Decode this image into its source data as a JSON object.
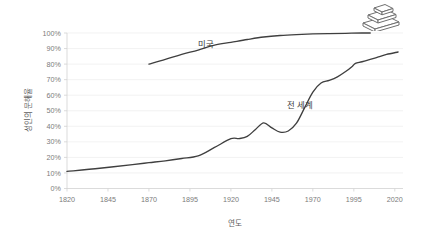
{
  "icon": {
    "name": "stacked-books-icon",
    "description": "stack of three books"
  },
  "chart_data": {
    "type": "line",
    "title": "",
    "xlabel": "연도",
    "ylabel": "성인의 문해율",
    "xlim": [
      1820,
      2025
    ],
    "ylim": [
      0,
      100
    ],
    "grid": true,
    "legend_position": "inline-labels",
    "xticks": [
      "1820",
      "1845",
      "1870",
      "1895",
      "1920",
      "1945",
      "1970",
      "1995",
      "2020"
    ],
    "xtick_values": [
      1820,
      1845,
      1870,
      1895,
      1920,
      1945,
      1970,
      1995,
      2020
    ],
    "yticks": [
      "0%",
      "10%",
      "20%",
      "30%",
      "40%",
      "50%",
      "60%",
      "70%",
      "80%",
      "90%",
      "100%"
    ],
    "ytick_values": [
      0,
      10,
      20,
      30,
      40,
      50,
      60,
      70,
      80,
      90,
      100
    ],
    "line_color": "#3f3f3f",
    "grid_color": "#ececed",
    "axis_color": "#d2d2d2",
    "series": [
      {
        "name": "미국",
        "label": "미국",
        "label_x": 1905,
        "label_y": 91,
        "x": [
          1870,
          1880,
          1890,
          1900,
          1910,
          1920,
          1930,
          1940,
          1950,
          1960,
          1970,
          1980,
          1990,
          2000,
          2005
        ],
        "values": [
          80.0,
          83.0,
          86.3,
          89.0,
          92.2,
          94.0,
          95.8,
          97.4,
          98.4,
          99.0,
          99.4,
          99.6,
          99.8,
          100.0,
          100.0
        ]
      },
      {
        "name": "전 세계",
        "label": "전 세계",
        "label_x": 1962,
        "label_y": 52,
        "x": [
          1820,
          1840,
          1860,
          1870,
          1880,
          1890,
          1900,
          1910,
          1920,
          1925,
          1930,
          1935,
          1940,
          1945,
          1950,
          1955,
          1960,
          1965,
          1970,
          1975,
          1980,
          1985,
          1990,
          1994,
          1996,
          2000,
          2005,
          2010,
          2015,
          2022
        ],
        "values": [
          11.0,
          13.0,
          15.4,
          16.6,
          17.8,
          19.3,
          21.0,
          26.4,
          32.0,
          32.1,
          33.5,
          38.0,
          42.2,
          39.0,
          36.3,
          37.0,
          42.0,
          52.0,
          62.0,
          67.8,
          69.5,
          71.8,
          75.2,
          78.5,
          80.5,
          81.5,
          83.0,
          84.6,
          86.2,
          87.8
        ]
      }
    ]
  }
}
